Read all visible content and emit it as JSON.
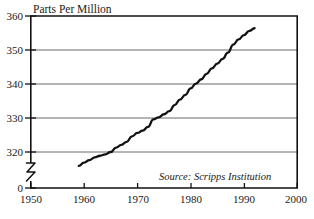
{
  "chart_data": {
    "type": "line",
    "title": "Parts Per Million",
    "xlabel": "",
    "ylabel": "Parts Per Million",
    "annotation": "Source: Scripps Institution",
    "grid": true,
    "legend": "none",
    "xlim": [
      1950,
      2000
    ],
    "ylim": [
      315,
      360
    ],
    "ytick_labels": [
      "360",
      "350",
      "340",
      "330",
      "320",
      "0"
    ],
    "ytick_values": [
      360,
      350,
      340,
      330,
      320,
      0
    ],
    "xtick_labels": [
      "1950",
      "1960",
      "1970",
      "1980",
      "1990",
      "2000"
    ],
    "xtick_values": [
      1950,
      1960,
      1970,
      1980,
      1990,
      2000
    ],
    "y_axis_break": true,
    "series": [
      {
        "name": "Atmospheric CO2 concentration",
        "x": [
          1959,
          1960,
          1961,
          1962,
          1963,
          1964,
          1965,
          1966,
          1967,
          1968,
          1969,
          1970,
          1971,
          1972,
          1973,
          1974,
          1975,
          1976,
          1977,
          1978,
          1979,
          1980,
          1981,
          1982,
          1983,
          1984,
          1985,
          1986,
          1987,
          1988,
          1989,
          1990,
          1991,
          1992
        ],
        "values": [
          315.9,
          316.9,
          317.6,
          318.4,
          318.9,
          319.3,
          320.0,
          321.3,
          322.1,
          323.0,
          324.6,
          325.6,
          326.3,
          327.4,
          329.6,
          330.2,
          331.1,
          332.0,
          333.8,
          335.4,
          336.8,
          338.7,
          340.1,
          341.4,
          343.0,
          344.6,
          346.0,
          347.4,
          349.2,
          351.6,
          353.1,
          354.4,
          355.6,
          356.4
        ]
      }
    ]
  },
  "figure": {
    "title_text": "Parts Per Million",
    "source_text": "Source: Scripps Institution"
  }
}
